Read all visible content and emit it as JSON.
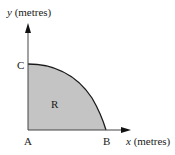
{
  "diagram": {
    "y_axis_label_var": "y",
    "y_axis_label_unit": " (metres)",
    "x_axis_label_var": "x",
    "x_axis_label_unit": " (metres)",
    "points": {
      "A": "A",
      "B": "B",
      "C": "C"
    },
    "region_label": "R",
    "colors": {
      "fill": "#c4c4c4",
      "line": "#1a1a1a",
      "axis": "#333333"
    }
  }
}
